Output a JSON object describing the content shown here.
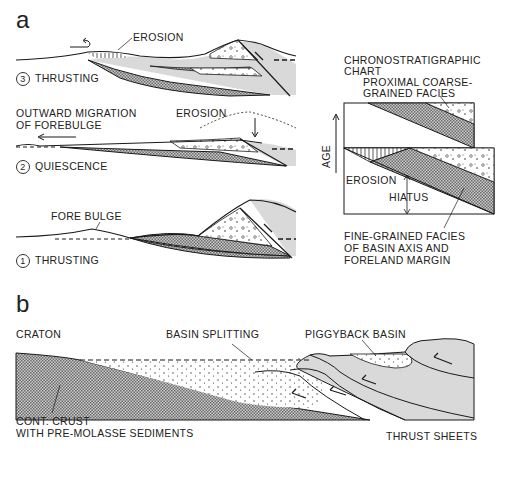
{
  "panel_a": {
    "label": "a",
    "stage3": {
      "number": "3",
      "title": "THRUSTING",
      "annotation": "EROSION"
    },
    "stage2": {
      "number": "2",
      "title": "QUIESCENCE",
      "annotation": "EROSION",
      "migration_line1": "OUTWARD MIGRATION",
      "migration_line2": "OF FOREBULGE"
    },
    "stage1": {
      "number": "1",
      "title": "THRUSTING",
      "annotation": "FORE BULGE"
    },
    "chrono": {
      "title_line1": "CHRONOSTRATIGRAPHIC",
      "title_line2": "CHART",
      "proximal_line1": "PROXIMAL COARSE-",
      "proximal_line2": "GRAINED FACIES",
      "axis_label": "AGE",
      "erosion": "EROSION",
      "hiatus": "HIATUS",
      "fine_line1": "FINE-GRAINED FACIES",
      "fine_line2": "OF BASIN AXIS AND",
      "fine_line3": "FORELAND MARGIN"
    }
  },
  "panel_b": {
    "label": "b",
    "craton": "CRATON",
    "basin_splitting": "BASIN SPLITTING",
    "piggyback": "PIGGYBACK BASIN",
    "crust_line1": "CONT. CRUST",
    "crust_line2": "WITH PRE-MOLASSE SEDIMENTS",
    "thrust_sheets": "THRUST SHEETS"
  },
  "colors": {
    "hatch": "#8a8a8a",
    "thrust_fill": "#d9d9d9",
    "line": "#1a1a1a"
  }
}
